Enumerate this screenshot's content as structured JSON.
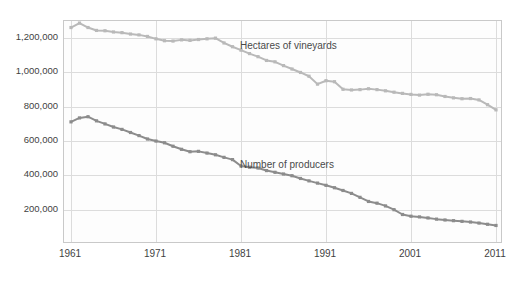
{
  "chart_data": {
    "type": "line",
    "title": "",
    "subtitle": "",
    "xlabel": "",
    "ylabel": "",
    "grid": true,
    "legend_position": "inline-annotation",
    "xlim": [
      1961,
      2011
    ],
    "ylim": [
      0,
      1300000
    ],
    "y_ticks": [
      200000,
      400000,
      600000,
      800000,
      1000000,
      1200000
    ],
    "y_tick_labels": [
      "200,000",
      "400,000",
      "600,000",
      "800,000",
      "1,000,000",
      "1,200,000"
    ],
    "x_ticks": [
      1961,
      1971,
      1981,
      1991,
      2001,
      2011
    ],
    "x_tick_labels": [
      "1961",
      "1971",
      "1981",
      "1991",
      "2001",
      "2011"
    ],
    "x": [
      1961,
      1962,
      1963,
      1964,
      1965,
      1966,
      1967,
      1968,
      1969,
      1970,
      1971,
      1972,
      1973,
      1974,
      1975,
      1976,
      1977,
      1978,
      1979,
      1980,
      1981,
      1982,
      1983,
      1984,
      1985,
      1986,
      1987,
      1988,
      1989,
      1990,
      1991,
      1992,
      1993,
      1994,
      1995,
      1996,
      1997,
      1998,
      1999,
      2000,
      2001,
      2002,
      2003,
      2004,
      2005,
      2006,
      2007,
      2008,
      2009,
      2010,
      2011
    ],
    "series": [
      {
        "name": "Hectares of vineyards",
        "color": "#b9b9b9",
        "label_x": 1981,
        "label_y": 1150000,
        "values": [
          1262000,
          1288000,
          1262000,
          1245000,
          1243000,
          1236000,
          1232000,
          1224000,
          1219000,
          1210000,
          1196000,
          1185000,
          1183000,
          1190000,
          1187000,
          1192000,
          1196000,
          1200000,
          1172000,
          1150000,
          1130000,
          1110000,
          1092000,
          1070000,
          1062000,
          1040000,
          1020000,
          1000000,
          978000,
          932000,
          952000,
          946000,
          902000,
          898000,
          900000,
          905000,
          900000,
          893000,
          885000,
          878000,
          872000,
          868000,
          873000,
          870000,
          860000,
          852000,
          847000,
          848000,
          840000,
          812000,
          782000
        ]
      },
      {
        "name": "Number of producers",
        "color": "#8c8c8c",
        "label_x": 1981,
        "label_y": 455000,
        "values": [
          712000,
          735000,
          742000,
          718000,
          700000,
          682000,
          668000,
          650000,
          632000,
          612000,
          600000,
          590000,
          570000,
          552000,
          538000,
          540000,
          530000,
          520000,
          505000,
          492000,
          455000,
          448000,
          443000,
          428000,
          418000,
          408000,
          398000,
          382000,
          368000,
          355000,
          342000,
          328000,
          312000,
          295000,
          272000,
          248000,
          238000,
          222000,
          200000,
          172000,
          162000,
          158000,
          152000,
          145000,
          140000,
          136000,
          132000,
          128000,
          122000,
          115000,
          108000
        ]
      }
    ]
  }
}
